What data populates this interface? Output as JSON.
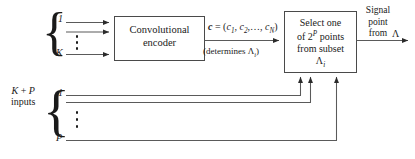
{
  "diagram": {
    "stroke_color": "#4a4a4a",
    "text_color": "#1a1a1a",
    "background": "#ffffff",
    "encoder_box": {
      "line1": "Convolutional",
      "line2": "encoder"
    },
    "select_box": {
      "line1": "Select one",
      "line2_pre": "of 2",
      "line2_sup": "P",
      "line2_post": " points",
      "line3": "from subset",
      "line4": "Λ",
      "line4_sub": "i"
    },
    "top_inputs": {
      "first_label": "1",
      "last_label": "K",
      "dots": "vertical-ellipsis"
    },
    "bottom_inputs": {
      "group_label_line1_pre": "K",
      "group_label_line1_mid": " + ",
      "group_label_line1_post": "P",
      "group_label_line2": "inputs",
      "first_label": "1",
      "last_label": "P",
      "dots": "vertical-ellipsis"
    },
    "codeword": {
      "bold_symbol": "c",
      "equals": " = (",
      "c1": "c",
      "c1_sub": "1",
      "sep1": ", ",
      "c2": "c",
      "c2_sub": "2",
      "sep2": ",…, ",
      "cN": "c",
      "cN_sub": "N",
      "close": ")"
    },
    "determines_note": {
      "pre": "(determines Λ",
      "sub": "i",
      "post": ")"
    },
    "output_label": {
      "line1": "Signal",
      "line2": "point",
      "line3": "from",
      "lambda": "Λ"
    }
  }
}
